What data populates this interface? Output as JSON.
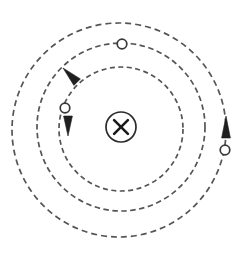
{
  "figure": {
    "background_color": "#ffffff",
    "width": 247,
    "height": 255,
    "center": {
      "x": 120,
      "y": 130
    }
  },
  "field_symbol": {
    "name": "magnetic-field-into-page",
    "label": "X",
    "center": {
      "x": 121,
      "y": 127
    },
    "radius": 15,
    "color": "#1a1a1a",
    "description": "circled X meaning magnetic field into the page"
  },
  "orbits": [
    {
      "id": "inner-orbit",
      "label": "inner orbit",
      "radius": 62,
      "cx": 121,
      "cy": 129,
      "stroke": "#555555",
      "dash": "5 3.5"
    },
    {
      "id": "middle-orbit",
      "label": "middle orbit",
      "radius": 84,
      "cx": 121,
      "cy": 127,
      "stroke": "#555555",
      "dash": "5.5 3.5"
    },
    {
      "id": "outer-orbit",
      "label": "outer orbit",
      "radius": 107,
      "cx": 119,
      "cy": 130,
      "stroke": "#555555",
      "dash": "6 4"
    }
  ],
  "particles": [
    {
      "id": "particle-top",
      "label": "particle on middle orbit",
      "cx": 122,
      "cy": 44,
      "radius": 4.8,
      "fill": "#ffffff",
      "stroke": "#3a3a3a",
      "on_orbit": "middle-orbit"
    },
    {
      "id": "particle-left",
      "label": "particle on inner orbit",
      "cx": 65,
      "cy": 108,
      "radius": 4.8,
      "fill": "#ffffff",
      "stroke": "#3a3a3a",
      "on_orbit": "inner-orbit"
    },
    {
      "id": "particle-right",
      "label": "particle on outer orbit",
      "cx": 225,
      "cy": 150,
      "radius": 4.8,
      "fill": "#ffffff",
      "stroke": "#3a3a3a",
      "on_orbit": "outer-orbit"
    }
  ],
  "arrows": [
    {
      "id": "arrow-middle-orbit",
      "label": "velocity arrow on middle orbit",
      "tip": {
        "x": 63,
        "y": 68
      },
      "direction_deg": 225,
      "length": 20,
      "half_width": 4.6,
      "sense": "counterclockwise",
      "color": "#1f1f1f"
    },
    {
      "id": "arrow-inner-orbit",
      "label": "velocity arrow on inner orbit",
      "tip": {
        "x": 68,
        "y": 136
      },
      "direction_deg": 90,
      "length": 20,
      "half_width": 4.4,
      "sense": "counterclockwise",
      "color": "#1f1f1f"
    },
    {
      "id": "arrow-outer-orbit",
      "label": "velocity arrow on outer orbit",
      "tip": {
        "x": 226,
        "y": 116
      },
      "direction_deg": 270,
      "length": 22,
      "half_width": 4.4,
      "sense": "counterclockwise",
      "color": "#1f1f1f"
    }
  ]
}
